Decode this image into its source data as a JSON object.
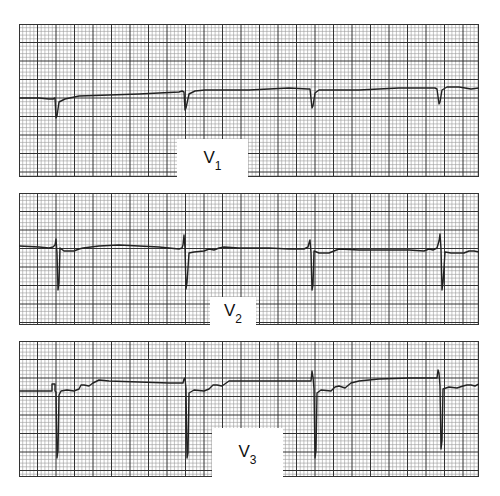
{
  "figure": {
    "grid": {
      "small_px": 3.7,
      "large_every": 5,
      "minor_color": "#9a9a9a",
      "major_color": "#333333",
      "paper_color": "#ffffff",
      "trace_color": "#222222"
    },
    "strips": [
      {
        "id": "v1",
        "lead": "V",
        "lead_sub": "1",
        "x": 19,
        "y": 24,
        "w": 460,
        "h": 153,
        "label_box": {
          "x": 177,
          "y": 139,
          "w": 71,
          "h": 40
        },
        "trace": "M0,74 L8,74 L20,74 L30,75 L34,75 L36,74 L37,94 L38,92 L40,78 L46,75 L60,72 L90,71 L120,70 L140,69 L160,68 L163,67 L165,68 L166,86 L167,84 L170,70 L176,67 L186,66 L200,66 L230,66 L250,65 L270,64 L289,65 L291,65 L293,84 L294,82 L296,69 L300,66 L320,66 L340,66 L360,65 L380,64 L400,64 L416,64 L418,65 L420,80 L421,78 L423,66 L428,63 L440,63 L446,64 L452,65 L460,64"
      },
      {
        "id": "v2",
        "lead": "V",
        "lead_sub": "2",
        "x": 19,
        "y": 193,
        "w": 460,
        "h": 132,
        "label_box": {
          "x": 210,
          "y": 297,
          "w": 46,
          "h": 30
        },
        "trace": "M0,53 L20,54 L30,55 L34,54 L36,52 L37,46 L38,60 L39,97 L40,90 L41,55 L45,58 L55,58 L60,56 L64,55 L80,53 L100,52 L120,53 L140,54 L160,56 L163,55 L164,52 L165,42 L166,55 L167,96 L168,90 L170,60 L175,59 L185,58 L190,56 L195,57 L200,55 L205,54 L220,55 L250,55 L270,56 L285,56 L289,54 L290,50 L291,47 L292,60 L293,97 L294,92 L295,58 L300,60 L310,60 L315,58 L320,56 L340,57 L370,57 L390,57 L405,58 L410,56 L414,57 L418,55 L420,48 L421,41 L422,56 L423,97 L424,90 L426,59 L432,60 L445,60 L450,58 L455,58 L460,59"
      },
      {
        "id": "v3",
        "lead": "V",
        "lead_sub": "3",
        "x": 19,
        "y": 341,
        "w": 460,
        "h": 136,
        "label_box": {
          "x": 212,
          "y": 428,
          "w": 71,
          "h": 50
        },
        "trace": "M0,50 L30,50 L33,50 L33,43 L36,43 L36,50 L37,51 L38,117 L39,110 L40,54 L42,50 L48,49 L55,50 L60,48 L62,44 L65,44 L70,45 L74,42 L80,39 L90,40 L120,41 L150,42 L164,42 L165,38 L166,37 L167,48 L168,117 L169,112 L170,52 L175,49 L185,50 L190,48 L194,44 L198,44 L203,45 L210,40 L220,40 L250,40 L285,40 L292,40 L293,30 L294,36 L295,48 L296,117 L297,110 L298,52 L302,49 L312,50 L316,46 L320,45 L326,47 L332,42 L340,40 L360,38 L390,37 L418,37 L419,29 L420,32 L421,45 L422,108 L423,100 L424,48 L430,46 L438,47 L444,45 L448,44 L452,44 L456,45 L460,43"
      }
    ]
  }
}
